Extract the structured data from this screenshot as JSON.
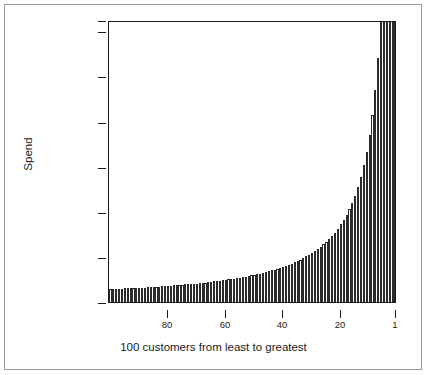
{
  "figure": {
    "background": "#ffffff",
    "frame_color": "#9a9a9a",
    "axis_color": "#1a1a1a",
    "bar_outline_color": "#2b2b2b",
    "bar_fill_color": "#ffffff"
  },
  "chart_data": {
    "type": "bar",
    "title": "",
    "subtitle": "",
    "xlabel": "100 customers from least to greatest",
    "ylabel": "Spend",
    "xlim": [
      100.5,
      0.5
    ],
    "ylim": [
      0,
      625
    ],
    "grid": false,
    "legend": null,
    "x_tick_labels": [
      "80",
      "60",
      "40",
      "20",
      "1"
    ],
    "x_tick_values": [
      80,
      60,
      40,
      20,
      1
    ],
    "y_tick_labels": [
      "0",
      "100",
      "200",
      "300",
      "400",
      "500",
      "600",
      "625"
    ],
    "y_tick_values": [
      0,
      100,
      200,
      300,
      400,
      500,
      600,
      625
    ],
    "n_bars": 100,
    "x_order": "rank 100 (least spend) at left to rank 1 (greatest spend) at right",
    "annotations": [
      "Top bars are clipped at the y-axis maximum of 625"
    ],
    "categories": [
      100,
      99,
      98,
      97,
      96,
      95,
      94,
      93,
      92,
      91,
      90,
      89,
      88,
      87,
      86,
      85,
      84,
      83,
      82,
      81,
      80,
      79,
      78,
      77,
      76,
      75,
      74,
      73,
      72,
      71,
      70,
      69,
      68,
      67,
      66,
      65,
      64,
      63,
      62,
      61,
      60,
      59,
      58,
      57,
      56,
      55,
      54,
      53,
      52,
      51,
      50,
      49,
      48,
      47,
      46,
      45,
      44,
      43,
      42,
      41,
      40,
      39,
      38,
      37,
      36,
      35,
      34,
      33,
      32,
      31,
      30,
      29,
      28,
      27,
      26,
      25,
      24,
      23,
      22,
      21,
      20,
      19,
      18,
      17,
      16,
      15,
      14,
      13,
      12,
      11,
      10,
      9,
      8,
      7,
      6,
      5,
      4,
      3,
      2,
      1
    ],
    "values": [
      28,
      28,
      29,
      29,
      29,
      30,
      30,
      30,
      31,
      31,
      31,
      32,
      32,
      33,
      33,
      33,
      34,
      34,
      35,
      35,
      36,
      36,
      37,
      37,
      38,
      38,
      39,
      39,
      40,
      41,
      41,
      42,
      43,
      43,
      44,
      45,
      46,
      46,
      47,
      48,
      49,
      50,
      51,
      52,
      53,
      54,
      55,
      56,
      58,
      59,
      60,
      62,
      63,
      65,
      66,
      68,
      70,
      72,
      74,
      76,
      78,
      80,
      83,
      85,
      88,
      91,
      94,
      97,
      101,
      104,
      108,
      113,
      117,
      122,
      128,
      133,
      140,
      147,
      154,
      162,
      172,
      182,
      193,
      206,
      220,
      236,
      255,
      277,
      303,
      333,
      370,
      415,
      470,
      540,
      625,
      625,
      625,
      625,
      625,
      625
    ]
  }
}
